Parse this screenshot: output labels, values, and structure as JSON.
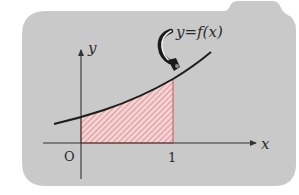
{
  "diagram": {
    "type": "area-under-curve",
    "curve_label": "y=f(x)",
    "axes": {
      "x_label": "x",
      "y_label": "y",
      "origin_label": "O",
      "x_tick_label": "1"
    },
    "colors": {
      "panel": "#c9c9c9",
      "axis": "#333333",
      "curve": "#1e1e1e",
      "hatch_fill": "#f3d2d2",
      "hatch_line": "#d9787a",
      "region_border": "#c84a4d",
      "text": "#2a2a2a"
    }
  }
}
